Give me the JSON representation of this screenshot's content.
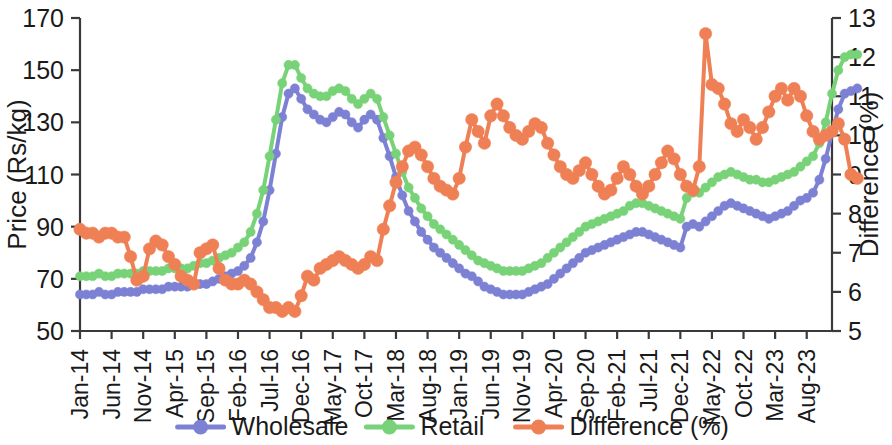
{
  "chart_data": {
    "type": "line",
    "title": "",
    "xlabel": "",
    "ylabel": "Price (Rs/kg)",
    "y2label": "Difference (%)",
    "ylim": [
      50,
      170
    ],
    "y2lim": [
      5,
      13
    ],
    "yticks": [
      50,
      70,
      90,
      110,
      130,
      150,
      170
    ],
    "y2ticks": [
      5,
      6,
      7,
      8,
      9,
      10,
      11,
      12,
      13
    ],
    "grid": false,
    "legend_position": "bottom",
    "xtick_labels": [
      "Jan-14",
      "Jun-14",
      "Nov-14",
      "Apr-15",
      "Sep-15",
      "Feb-16",
      "Jul-16",
      "Dec-16",
      "May-17",
      "Oct-17",
      "Mar-18",
      "Aug-18",
      "Jan-19",
      "Jun-19",
      "Nov-19",
      "Apr-20",
      "Sep-20",
      "Feb-21",
      "Jul-21",
      "Dec-21",
      "May-22",
      "Oct-22",
      "Mar-23",
      "Aug-23"
    ],
    "xtick_interval_months": 5,
    "x_start": "Jan-14",
    "x_end": "Dec-23",
    "n_points": 120,
    "series": [
      {
        "name": "Wholesale",
        "axis": "left",
        "unit": "Rs/kg",
        "color": "#7d81d4",
        "marker": "circle",
        "values": [
          64,
          64,
          64,
          65,
          64,
          64,
          65,
          65,
          65,
          65,
          66,
          66,
          66,
          66,
          67,
          67,
          67,
          67,
          68,
          68,
          68,
          69,
          70,
          71,
          72,
          73,
          75,
          78,
          84,
          92,
          104,
          118,
          132,
          141,
          143,
          139,
          135,
          133,
          131,
          130,
          132,
          134,
          133,
          130,
          128,
          131,
          133,
          131,
          124,
          117,
          109,
          102,
          96,
          92,
          88,
          85,
          82,
          80,
          78,
          76,
          74,
          72,
          71,
          69,
          67,
          66,
          65,
          64,
          64,
          64,
          64,
          65,
          66,
          67,
          68,
          70,
          72,
          74,
          76,
          78,
          80,
          81,
          82,
          83,
          84,
          85,
          86,
          87,
          88,
          88,
          87,
          86,
          85,
          84,
          83,
          82,
          90,
          91,
          90,
          92,
          94,
          96,
          98,
          99,
          98,
          97,
          96,
          95,
          94,
          93,
          94,
          95,
          96,
          98,
          100,
          101,
          103,
          108,
          116,
          126,
          135,
          141,
          142,
          143
        ]
      },
      {
        "name": "Retail",
        "axis": "left",
        "unit": "Rs/kg",
        "color": "#78d277",
        "marker": "circle",
        "values": [
          71,
          71,
          71,
          72,
          71,
          71,
          72,
          72,
          72,
          72,
          73,
          73,
          73,
          73,
          74,
          74,
          74,
          74,
          75,
          76,
          76,
          77,
          78,
          79,
          80,
          82,
          84,
          88,
          95,
          104,
          117,
          131,
          145,
          152,
          152,
          147,
          143,
          141,
          140,
          140,
          142,
          143,
          142,
          139,
          137,
          139,
          141,
          139,
          132,
          125,
          118,
          111,
          105,
          101,
          97,
          94,
          91,
          89,
          87,
          85,
          83,
          81,
          79,
          77,
          76,
          75,
          74,
          73,
          73,
          73,
          73,
          74,
          75,
          76,
          78,
          80,
          82,
          84,
          86,
          88,
          90,
          91,
          92,
          93,
          94,
          95,
          96,
          98,
          99,
          99,
          98,
          97,
          96,
          95,
          94,
          93,
          101,
          103,
          103,
          105,
          107,
          109,
          110,
          111,
          110,
          109,
          108,
          108,
          107,
          107,
          108,
          109,
          110,
          111,
          113,
          115,
          117,
          122,
          130,
          141,
          150,
          155,
          156,
          156
        ]
      },
      {
        "name": "Difference (%)",
        "axis": "right",
        "unit": "%",
        "color": "#ef8055",
        "marker": "circle",
        "values": [
          7.6,
          7.5,
          7.5,
          7.4,
          7.5,
          7.5,
          7.4,
          7.4,
          6.9,
          6.3,
          6.4,
          7.1,
          7.3,
          7.2,
          6.9,
          6.7,
          6.4,
          6.3,
          6.2,
          7.0,
          7.1,
          7.2,
          6.6,
          6.3,
          6.2,
          6.2,
          6.3,
          6.2,
          6.0,
          5.8,
          5.6,
          5.6,
          5.5,
          5.6,
          5.5,
          5.9,
          6.4,
          6.3,
          6.6,
          6.7,
          6.8,
          6.9,
          6.8,
          6.7,
          6.6,
          6.7,
          6.9,
          6.8,
          7.6,
          8.2,
          8.8,
          9.2,
          9.6,
          9.7,
          9.5,
          9.2,
          8.9,
          8.7,
          8.6,
          8.5,
          8.9,
          9.7,
          10.4,
          10.1,
          9.8,
          10.5,
          10.8,
          10.5,
          10.2,
          10.0,
          9.9,
          10.1,
          10.3,
          10.2,
          9.8,
          9.5,
          9.2,
          9.0,
          8.9,
          9.1,
          9.3,
          9.0,
          8.7,
          8.5,
          8.6,
          8.9,
          9.2,
          9.0,
          8.7,
          8.5,
          8.7,
          9.0,
          9.3,
          9.6,
          9.4,
          9.0,
          8.7,
          8.6,
          9.2,
          12.6,
          11.3,
          11.2,
          10.8,
          10.3,
          10.1,
          10.4,
          10.2,
          9.9,
          10.2,
          10.6,
          11.0,
          11.2,
          10.9,
          11.2,
          11.0,
          10.5,
          10.1,
          9.9,
          10.0,
          10.1,
          10.3,
          9.9,
          9.0,
          8.9
        ]
      }
    ],
    "annotations": {
      "peak_retail": 156,
      "peak_wholesale": 143,
      "peak_difference": 12.6,
      "min_difference": 5.5
    }
  },
  "legend": {
    "items": [
      {
        "label": "Wholesale",
        "color": "#7d81d4"
      },
      {
        "label": "Retail",
        "color": "#78d277"
      },
      {
        "label": "Difference (%)",
        "color": "#ef8055"
      }
    ]
  },
  "axes": {
    "left_title": "Price (Rs/kg)",
    "right_title": "Difference (%)"
  }
}
